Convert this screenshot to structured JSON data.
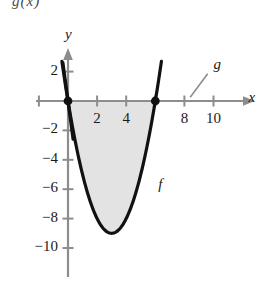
{
  "figure": {
    "top_cut_text": "g(x)",
    "axis_labels": {
      "x": "x",
      "y": "y"
    },
    "curve_labels": {
      "parabola": "f",
      "line": "g"
    },
    "colors": {
      "curve": "#111111",
      "axis": "#888888",
      "shade": "#e3e3e3",
      "text": "#1a1a1a"
    },
    "x_tick_labels": [
      "2",
      "4",
      "8",
      "10"
    ],
    "y_tick_labels": [
      "2",
      "-2",
      "-4",
      "-6",
      "-8",
      "-10"
    ]
  },
  "chart_data": {
    "type": "line",
    "title": "",
    "xlabel": "x",
    "ylabel": "y",
    "xlim": [
      -1.5,
      12
    ],
    "ylim": [
      -11.5,
      3.5
    ],
    "grid": false,
    "legend": "none",
    "x_ticks": [
      2,
      4,
      6,
      8,
      10
    ],
    "x_tick_labels": [
      "2",
      "4",
      "",
      "8",
      "10"
    ],
    "y_ticks": [
      2,
      -2,
      -4,
      -6,
      -8,
      -10
    ],
    "y_tick_labels": [
      "2",
      "-2",
      "-4",
      "-6",
      "-8",
      "-10"
    ],
    "series": [
      {
        "name": "f",
        "type": "parabola",
        "label": "f",
        "label_at": [
          6.2,
          -5.8
        ],
        "roots": [
          0,
          6
        ],
        "vertex": [
          3,
          -9
        ],
        "equation_points": [
          [
            -0.4,
            2.7
          ],
          [
            0,
            0
          ],
          [
            0.5,
            -2.75
          ],
          [
            1,
            -5.0
          ],
          [
            1.5,
            -6.75
          ],
          [
            2,
            -8.0
          ],
          [
            2.5,
            -8.75
          ],
          [
            3,
            -9.0
          ],
          [
            3.5,
            -8.75
          ],
          [
            4,
            -8.0
          ],
          [
            4.5,
            -6.75
          ],
          [
            5,
            -5.0
          ],
          [
            5.5,
            -2.75
          ],
          [
            6,
            0
          ],
          [
            6.4,
            2.7
          ]
        ]
      },
      {
        "name": "g",
        "type": "line",
        "label": "g",
        "label_at": [
          10.0,
          2.3
        ],
        "leader_from": [
          8.4,
          0.25
        ],
        "leader_to": [
          9.6,
          1.85
        ],
        "points": [
          [
            -0.35,
            2.6
          ],
          [
            0.35,
            -2.6
          ]
        ]
      }
    ],
    "marked_points": [
      {
        "x": 0,
        "y": 0,
        "style": "filled-dot"
      },
      {
        "x": 6,
        "y": 0,
        "style": "filled-dot"
      }
    ],
    "shaded_region": {
      "between": [
        "f",
        "x-axis"
      ],
      "from_x": 0,
      "to_x": 6,
      "color": "#e3e3e3"
    },
    "annotations": [
      {
        "text": "f",
        "x": 6.2,
        "y": -5.8
      },
      {
        "text": "g",
        "x": 10.0,
        "y": 2.3
      }
    ]
  }
}
